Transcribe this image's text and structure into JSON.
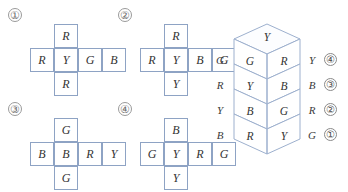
{
  "nets": [
    {
      "id": "net-1",
      "number": "①",
      "top": "R",
      "row": [
        "R",
        "Y",
        "G",
        "B"
      ],
      "bottom": "R"
    },
    {
      "id": "net-2",
      "number": "②",
      "top": "R",
      "row": [
        "R",
        "Y",
        "B",
        "G"
      ],
      "bottom": "Y"
    },
    {
      "id": "net-3",
      "number": "③",
      "top": "G",
      "row": [
        "B",
        "B",
        "R",
        "Y"
      ],
      "bottom": "G"
    },
    {
      "id": "net-4",
      "number": "④",
      "top": "B",
      "row": [
        "G",
        "Y",
        "R",
        "G"
      ],
      "bottom": "Y"
    }
  ],
  "stack": {
    "top_face": "Y",
    "cubes": [
      {
        "left_face": "G",
        "right_face": "R"
      },
      {
        "left_face": "Y",
        "right_face": "B"
      },
      {
        "left_face": "B",
        "right_face": "G"
      },
      {
        "left_face": "R",
        "right_face": "Y"
      }
    ],
    "left_labels": [
      "G",
      "R",
      "Y",
      "B"
    ],
    "right_labels": [
      {
        "letter": "Y",
        "number": "④"
      },
      {
        "letter": "B",
        "number": "③"
      },
      {
        "letter": "R",
        "number": "②"
      },
      {
        "letter": "G",
        "number": "①"
      }
    ]
  },
  "colors": {
    "cell_border": "#8ea3c4",
    "cube_line": "#9db0ce",
    "text": "#333333",
    "background": "#ffffff"
  }
}
